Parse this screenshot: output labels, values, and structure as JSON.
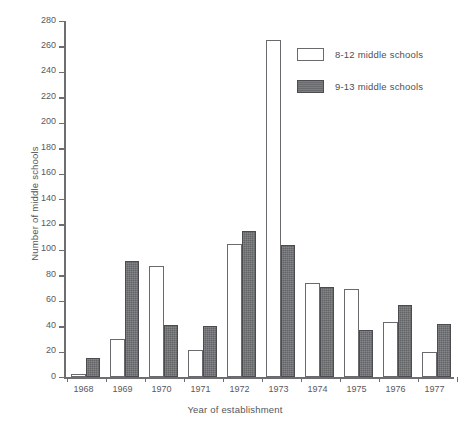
{
  "chart_data": {
    "type": "bar",
    "title": "",
    "xlabel": "Year of establishment",
    "ylabel": "Number of middle schools",
    "categories": [
      "1968",
      "1969",
      "1970",
      "1971",
      "1972",
      "1973",
      "1974",
      "1975",
      "1976",
      "1977"
    ],
    "series": [
      {
        "name": "8-12 middle schools",
        "color": "#ffffff",
        "values": [
          2,
          30,
          87,
          21,
          105,
          265,
          74,
          69,
          43,
          20
        ]
      },
      {
        "name": "9-13 middle schools",
        "color": "#6f7073",
        "values": [
          15,
          91,
          41,
          40,
          115,
          104,
          71,
          37,
          57,
          42
        ]
      }
    ],
    "ylim": [
      0,
      280
    ],
    "yticks": [
      0,
      20,
      40,
      60,
      80,
      100,
      120,
      140,
      160,
      180,
      200,
      220,
      240,
      260,
      280
    ],
    "ytick_labels": [
      "0",
      "20",
      "40",
      "60",
      "80",
      "100",
      "120",
      "140",
      "160",
      "180",
      "200",
      "220",
      "240",
      "260",
      "280"
    ],
    "grid": false,
    "legend_position": "top-right",
    "legend": [
      "8-12 middle schools",
      "9-13 middle schools"
    ]
  }
}
